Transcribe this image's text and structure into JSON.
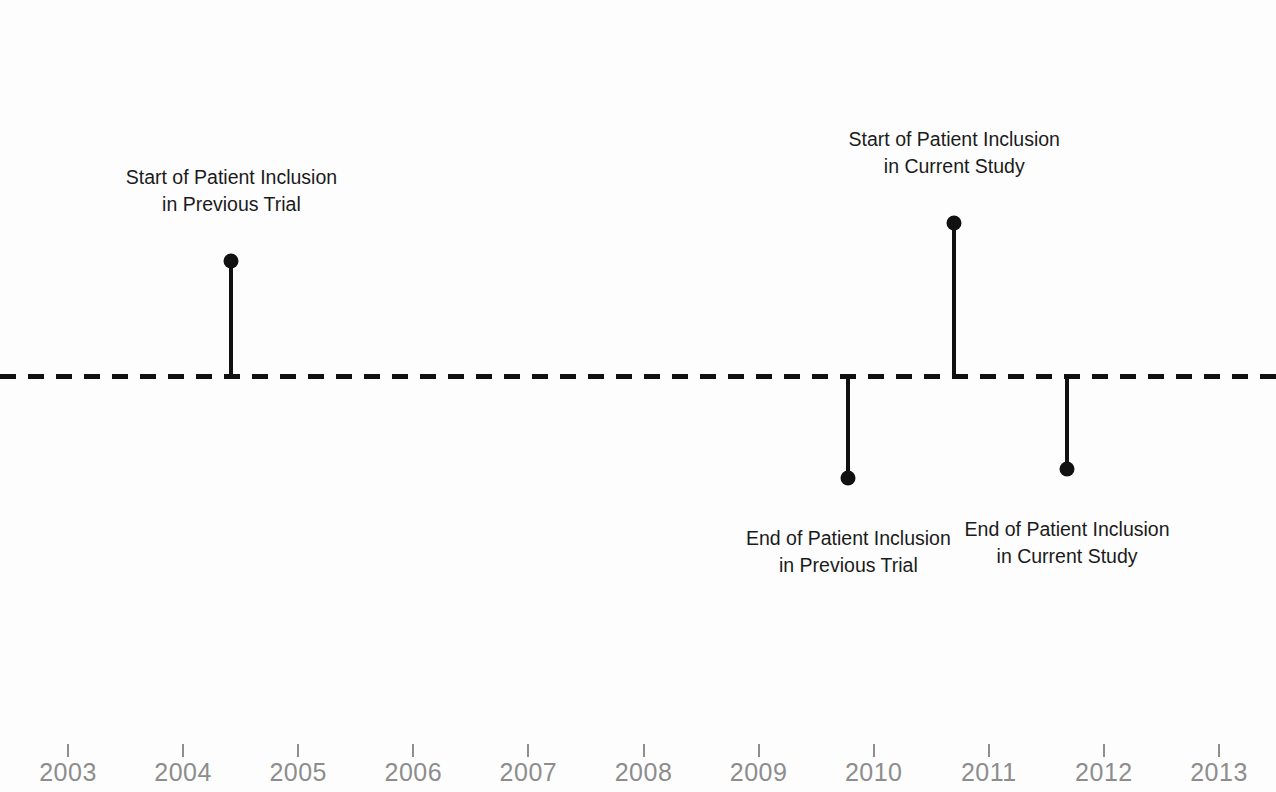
{
  "figure": {
    "title_cropped": "Study Timeline",
    "background_color": "#fdfdfd",
    "marker_color": "#111111",
    "axis_color": "#8d8d8d"
  },
  "chart_data": {
    "type": "line",
    "title": "Study Timeline",
    "xlabel": "",
    "ylabel": "",
    "xlim": [
      2002.41,
      2013.5
    ],
    "ylim": [
      -1.35,
      1.35
    ],
    "grid": false,
    "legend": "none",
    "baseline": {
      "y": 0,
      "style": "dashed",
      "color": "#101010",
      "dash_on_px": 16,
      "dash_off_px": 12,
      "thickness_px": 5
    },
    "x_ticks": [
      2003,
      2004,
      2005,
      2006,
      2007,
      2008,
      2009,
      2010,
      2011,
      2012,
      2013
    ],
    "x_tick_labels": [
      "2003",
      "2004",
      "2005",
      "2006",
      "2007",
      "2008",
      "2009",
      "2010",
      "2011",
      "2012",
      "2013"
    ],
    "y_ticks": [],
    "y_tick_labels": [],
    "events": [
      {
        "id": "start-previous-trial",
        "label_line1": "Start of Patient Inclusion",
        "label_line2": "in Previous Trial",
        "x": 2004.42,
        "y": 0.98,
        "direction": "up"
      },
      {
        "id": "end-previous-trial",
        "label_line1": "End of Patient Inclusion",
        "label_line2": "in Previous Trial",
        "x": 2009.78,
        "y": -0.87,
        "direction": "down"
      },
      {
        "id": "start-current-study",
        "label_line1": "Start of Patient Inclusion",
        "label_line2": "in Current Study",
        "x": 2010.7,
        "y": 1.3,
        "direction": "up"
      },
      {
        "id": "end-current-study",
        "label_line1": "End of Patient Inclusion",
        "label_line2": "in Current Study",
        "x": 2011.68,
        "y": -0.79,
        "direction": "down"
      }
    ]
  },
  "geometry": {
    "width": 1276,
    "height": 792,
    "baseline_y_px": 376,
    "x_origin_year": 2003,
    "x_origin_px": 68,
    "px_per_year": 115.1,
    "events_px": [
      {
        "x": 232,
        "tip_y": 265,
        "label_y": 168,
        "direction": "up"
      },
      {
        "x": 848,
        "tip_y": 484,
        "label_y": 531,
        "direction": "down"
      },
      {
        "x": 953,
        "tip_y": 223,
        "label_y": 129,
        "direction": "up"
      },
      {
        "x": 1067,
        "tip_y": 474,
        "label_y": 521,
        "direction": "down"
      }
    ],
    "ticks_px": [
      68,
      183.1,
      298.2,
      413.3,
      528.4,
      643.5,
      758.6,
      873.7,
      988.8,
      1103.9,
      1219
    ]
  }
}
